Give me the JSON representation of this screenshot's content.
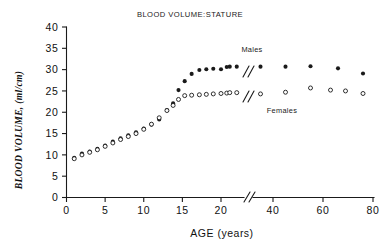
{
  "chart_data": {
    "type": "scatter",
    "title": "BLOOD VOLUME:STATURE",
    "xlabel": "AGE  (years)",
    "ylabel": "BLOOD VOLUME, (ml/cm)",
    "xlim": [
      0,
      80
    ],
    "ylim": [
      0,
      40
    ],
    "x_ticks": [
      "0",
      "5",
      "10",
      "15",
      "20",
      "40",
      "60",
      "80"
    ],
    "y_ticks": [
      "0",
      "5",
      "10",
      "15",
      "20",
      "25",
      "30",
      "35",
      "40"
    ],
    "grid": false,
    "axis_break": {
      "present": true,
      "symbol": "//",
      "between": [
        20,
        40
      ],
      "note": "x-axis compressed after age 20"
    },
    "legend": {
      "position": "inline-right",
      "entries": [
        {
          "name": "Males",
          "marker": "filled-circle"
        },
        {
          "name": "Females",
          "marker": "open-circle"
        }
      ]
    },
    "series": [
      {
        "name": "Males",
        "marker": "filled-circle",
        "points": [
          [
            1.0,
            9.3
          ],
          [
            2.0,
            10.3
          ],
          [
            3.0,
            10.8
          ],
          [
            4.0,
            11.4
          ],
          [
            5.0,
            12.2
          ],
          [
            6.0,
            13.1
          ],
          [
            7.0,
            13.9
          ],
          [
            8.0,
            14.6
          ],
          [
            9.0,
            15.3
          ],
          [
            10.0,
            16.2
          ],
          [
            11.0,
            17.1
          ],
          [
            12.0,
            18.3
          ],
          [
            13.0,
            20.5
          ],
          [
            13.8,
            22.1
          ],
          [
            14.5,
            25.2
          ],
          [
            15.3,
            27.3
          ],
          [
            16.2,
            29.0
          ],
          [
            17.2,
            29.9
          ],
          [
            18.1,
            30.1
          ],
          [
            19.0,
            30.2
          ],
          [
            20.0,
            30.1
          ],
          [
            21.5,
            30.6
          ],
          [
            22.7,
            30.7
          ],
          [
            25.5,
            30.7
          ],
          [
            35.0,
            30.7
          ],
          [
            45.0,
            30.7
          ],
          [
            55.0,
            30.8
          ],
          [
            66.0,
            30.3
          ],
          [
            76.0,
            29.1
          ]
        ]
      },
      {
        "name": "Females",
        "marker": "open-circle",
        "points": [
          [
            1.0,
            9.1
          ],
          [
            2.0,
            10.0
          ],
          [
            3.0,
            10.6
          ],
          [
            4.0,
            11.2
          ],
          [
            5.0,
            12.0
          ],
          [
            6.0,
            12.8
          ],
          [
            7.0,
            13.6
          ],
          [
            8.0,
            14.3
          ],
          [
            9.0,
            15.0
          ],
          [
            10.0,
            16.0
          ],
          [
            11.0,
            17.2
          ],
          [
            12.0,
            18.7
          ],
          [
            13.0,
            20.4
          ],
          [
            13.8,
            21.6
          ],
          [
            14.5,
            23.0
          ],
          [
            15.3,
            23.9
          ],
          [
            16.2,
            24.0
          ],
          [
            17.2,
            24.1
          ],
          [
            18.1,
            24.2
          ],
          [
            19.0,
            24.3
          ],
          [
            20.0,
            24.4
          ],
          [
            21.5,
            24.5
          ],
          [
            22.7,
            24.6
          ],
          [
            25.5,
            24.6
          ],
          [
            35.0,
            24.3
          ],
          [
            45.0,
            24.7
          ],
          [
            55.0,
            25.7
          ],
          [
            63.0,
            25.2
          ],
          [
            69.0,
            25.0
          ],
          [
            76.0,
            24.4
          ]
        ]
      }
    ]
  }
}
